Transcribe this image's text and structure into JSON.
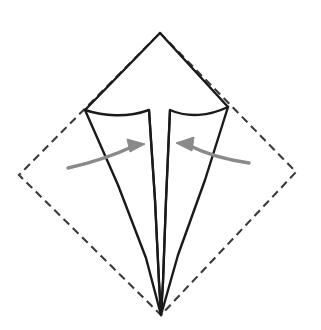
{
  "canvas": {
    "width": 321,
    "height": 330,
    "background_color": "#ffffff"
  },
  "diagram": {
    "type": "origami-fold-step"
  },
  "colors": {
    "fold_line": "#1a1a1a",
    "dashed_outline": "#3a3a3a",
    "arrow": "#8a8a8a",
    "paper_fill": "#ffffff"
  },
  "shapes": {
    "dashed_square": {
      "name": "original-paper-outline",
      "style": "dashed",
      "stroke_width": 2.1,
      "dash_pattern": "8 5",
      "points": [
        [
          160,
          33
        ],
        [
          296,
          172
        ],
        [
          161,
          315
        ],
        [
          19,
          175
        ]
      ]
    },
    "kite_top_left": {
      "name": "upper-left-flap",
      "points": [
        [
          160,
          33
        ],
        [
          85,
          110
        ]
      ]
    },
    "kite_top_right": {
      "name": "upper-right-flap",
      "points": [
        [
          160,
          33
        ],
        [
          228,
          107
        ]
      ]
    },
    "left_panel": {
      "name": "left-folded-panel",
      "stroke_width": 2.4,
      "path_note": "from left corner curving right to T-shoulder, down the inner stem, to bottom point, back up outer edge"
    },
    "right_panel": {
      "name": "right-folded-panel",
      "stroke_width": 2.4,
      "path_note": "from right corner curving left to T-shoulder, down the inner stem, to bottom point, back up outer edge"
    },
    "center_slit": {
      "name": "central-vertical-slit",
      "top_left_x": 149,
      "top_right_x": 170,
      "top_y": 110,
      "bottom_point": [
        161,
        315
      ]
    }
  },
  "arrows": [
    {
      "name": "left-fold-arrow",
      "direction": "right",
      "color": "#8a8a8a",
      "stroke_width": 3.4,
      "start": [
        68,
        168
      ],
      "control": [
        104,
        160
      ],
      "end": [
        136,
        146
      ],
      "head_tip": [
        144,
        144
      ]
    },
    {
      "name": "right-fold-arrow",
      "direction": "left",
      "color": "#8a8a8a",
      "stroke_width": 3.4,
      "start": [
        249,
        163
      ],
      "control": [
        214,
        158
      ],
      "end": [
        186,
        145
      ],
      "head_tip": [
        177,
        143
      ]
    }
  ]
}
